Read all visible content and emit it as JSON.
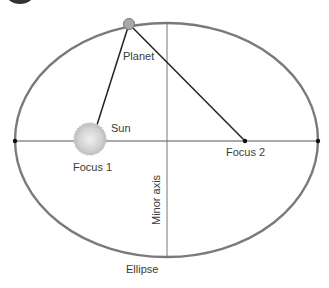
{
  "diagram": {
    "labels": {
      "planet": "Planet",
      "sun": "Sun",
      "focus1": "Focus 1",
      "focus2": "Focus 2",
      "minor_axis": "Minor axis",
      "ellipse": "Ellipse"
    },
    "colors": {
      "ellipse": "#777777",
      "lines": "#222222",
      "planet": "#a9a9a9",
      "sun": "#d8d8d8",
      "badge": "#333333"
    }
  }
}
